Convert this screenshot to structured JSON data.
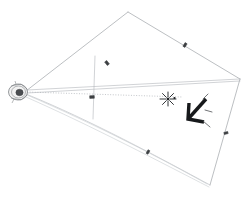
{
  "figure": {
    "background_color": "#ffffff",
    "width": 249,
    "height": 200,
    "caption": ""
  },
  "colors": {
    "frustum_edge": "#9fa3a8",
    "ray_line": "#b2b6ba",
    "ray_line_faint": "#c8ccd0",
    "axis_dotted": "#9aa0a6",
    "tick_mark": "#3c3f42",
    "arrow": "#17191b",
    "star_marker": "#1c1f22",
    "camera_body": "#f2f2f2",
    "camera_dark": "#4a4d50"
  },
  "camera": {
    "label": "camera",
    "center_x": 18,
    "center_y": 92
  },
  "frustum": {
    "label": "projection-quadrilateral",
    "vertices": [
      {
        "name": "top",
        "x": 128,
        "y": 12
      },
      {
        "name": "right",
        "x": 240,
        "y": 79
      },
      {
        "name": "bottom",
        "x": 210,
        "y": 185
      },
      {
        "name": "left-lower",
        "x": 93,
        "y": 118
      }
    ],
    "points_path": "128,12 240,79 210,185"
  },
  "rays": {
    "label": "projection-rays",
    "paths": [
      {
        "name": "ray-to-top-vertex",
        "d": "M 26,91 L 128,12"
      },
      {
        "name": "ray-to-right-vertex-upper",
        "d": "M 26,91 L 240,79"
      },
      {
        "name": "ray-to-target-center",
        "d": "M 26,91 L 240,81"
      },
      {
        "name": "ray-to-bottom-vertex",
        "d": "M 26,94 C 90,120 160,158 210,185"
      },
      {
        "name": "ray-to-bottom-vertex-2",
        "d": "M 26,97 C 92,125 162,163 208,187"
      },
      {
        "name": "ray-left-lower-edge",
        "d": "M 26,93 L 93,118"
      }
    ]
  },
  "image_plane": {
    "label": "near-image-plane",
    "vertical_d": "M 95,57 L 93,118",
    "horizontal_d": "M 26,91 L 240,81"
  },
  "tick_labels": [
    {
      "name": "tick-upper-left-edge",
      "x": 107,
      "y": 63,
      "angle": -38
    },
    {
      "name": "tick-upper-right-edge",
      "x": 185,
      "y": 45,
      "angle": 32
    },
    {
      "name": "tick-image-plane",
      "x": 92,
      "y": 97,
      "angle": 88
    },
    {
      "name": "tick-lower-ray",
      "x": 148,
      "y": 152,
      "angle": 30
    },
    {
      "name": "tick-right-lower-edge",
      "x": 226,
      "y": 133,
      "angle": 75
    }
  ],
  "target_marker": {
    "label": "star-target",
    "x": 168,
    "y": 99,
    "dot_x": 174,
    "dot_y": 98,
    "rays": 8
  },
  "arrow_annotation": {
    "label": "bold-arrow-pointer",
    "direction": "down-left",
    "tip_x": 188,
    "tip_y": 118,
    "tail_x": 205,
    "tail_y": 100
  }
}
